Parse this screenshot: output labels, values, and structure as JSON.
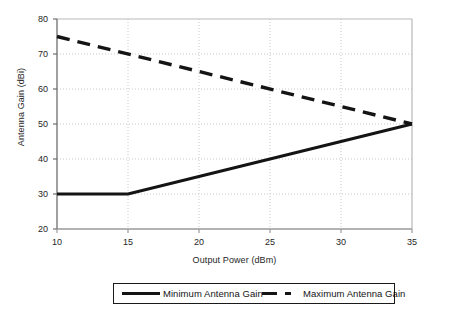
{
  "chart_data": {
    "type": "line",
    "title": "",
    "xlabel": "Output Power (dBm)",
    "ylabel": "Antenna Gain (dBi)",
    "xlim": [
      10,
      35
    ],
    "ylim": [
      20,
      80
    ],
    "xticks": [
      10,
      15,
      20,
      25,
      30,
      35
    ],
    "yticks": [
      20,
      30,
      40,
      50,
      60,
      70,
      80
    ],
    "xtick_labels": [
      "10",
      "15",
      "20",
      "25",
      "30",
      "35"
    ],
    "ytick_labels": [
      "20",
      "30",
      "40",
      "50",
      "60",
      "70",
      "80"
    ],
    "grid": "horizontal-and-vertical-dotted",
    "legend_position": "below-plot",
    "series": [
      {
        "name": "Minimum Antenna Gain",
        "style": "solid",
        "color": "#141414",
        "x": [
          10,
          15,
          35
        ],
        "values": [
          30,
          30,
          50
        ]
      },
      {
        "name": "Maximum Antenna Gain",
        "style": "dashed",
        "color": "#141414",
        "x": [
          10,
          35
        ],
        "values": [
          75,
          50
        ]
      }
    ]
  },
  "legend": {
    "items": [
      {
        "label": "Minimum Antenna Gain",
        "style": "solid"
      },
      {
        "label": "Maximum Antenna Gain",
        "style": "dashed"
      }
    ]
  },
  "axes": {
    "x_title": "Output Power (dBm)",
    "y_title": "Antenna Gain (dBi)"
  },
  "colors": {
    "line": "#141414",
    "axis": "#7a7a7a",
    "grid": "#c8c8c8",
    "text": "#262626",
    "background": "#ffffff"
  }
}
